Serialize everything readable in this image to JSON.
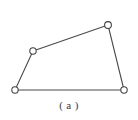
{
  "figure": {
    "caption": "( a )",
    "background_color": "#ffffff",
    "line_color": "#4a4a4a",
    "vertex_fill_color": "#ffffff",
    "vertex_stroke_color": "#3f3f3f",
    "caption_color": "#3b3b3b",
    "shape_name": "quadrilateral",
    "vertex_count": "4",
    "edge_count": "4"
  },
  "chart_data": {
    "type": "scatter",
    "title": "( a )",
    "xlabel": "",
    "ylabel": "",
    "grid": false,
    "legend": null,
    "xlim": [
      0,
      138
    ],
    "ylim": [
      0,
      120
    ],
    "vertices": [
      {
        "id": "bottom-left",
        "x": 15,
        "y": 90,
        "r": 3.2
      },
      {
        "id": "mid-left",
        "x": 33,
        "y": 51,
        "r": 3.2
      },
      {
        "id": "top-right",
        "x": 108,
        "y": 25,
        "r": 3.4
      },
      {
        "id": "bottom-right",
        "x": 124,
        "y": 90,
        "r": 3.2
      }
    ],
    "edges": [
      {
        "id": "left-edge",
        "from": "bottom-left",
        "to": "mid-left",
        "x1": 15,
        "y1": 90,
        "x2": 33,
        "y2": 51
      },
      {
        "id": "top-edge",
        "from": "mid-left",
        "to": "top-right",
        "x1": 33,
        "y1": 51,
        "x2": 108,
        "y2": 25
      },
      {
        "id": "right-edge",
        "from": "top-right",
        "to": "bottom-right",
        "x1": 108,
        "y1": 25,
        "x2": 124,
        "y2": 90
      },
      {
        "id": "bottom-edge",
        "from": "bottom-right",
        "to": "bottom-left",
        "x1": 124,
        "y1": 90,
        "x2": 15,
        "y2": 90
      }
    ]
  }
}
